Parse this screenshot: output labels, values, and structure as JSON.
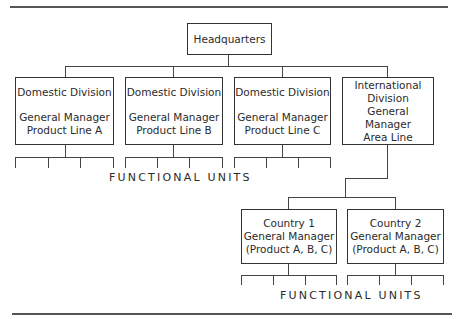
{
  "headquarters": {
    "label": "Headquarters"
  },
  "divisions": [
    {
      "title": "Domestic Division",
      "manager": "General Manager",
      "line": "Product Line A"
    },
    {
      "title": "Domestic Division",
      "manager": "General Manager",
      "line": "Product Line B"
    },
    {
      "title": "Domestic Division",
      "manager": "General Manager",
      "line": "Product Line C"
    },
    {
      "title_line1": "International",
      "title_line2": "Division",
      "manager": "General Manager",
      "line": "Area Line"
    }
  ],
  "countries": [
    {
      "title": "Country 1",
      "manager": "General Manager",
      "products": "(Product A, B, C)"
    },
    {
      "title": "Country 2",
      "manager": "General Manager",
      "products": "(Product A, B, C)"
    }
  ],
  "functional_units_labels": {
    "top": "FUNCTIONAL UNITS",
    "bottom": "FUNCTIONAL UNITS"
  }
}
